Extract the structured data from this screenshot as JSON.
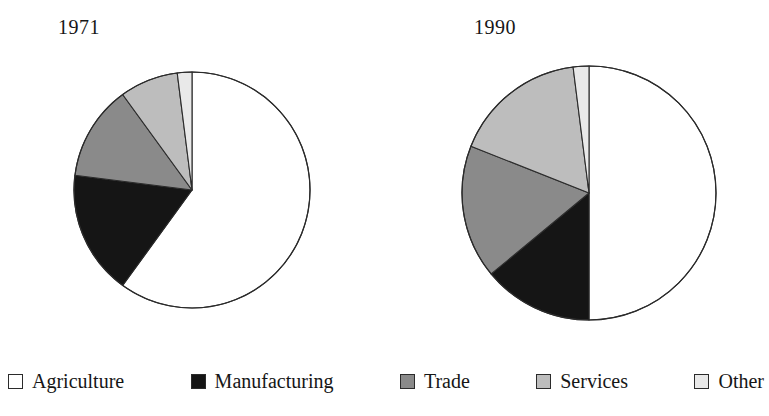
{
  "chart_data": {
    "type": "pie",
    "title": "",
    "categories": [
      "Agriculture",
      "Manufacturing",
      "Trade",
      "Services",
      "Other"
    ],
    "colors": [
      "#ffffff",
      "#151515",
      "#8a8a8a",
      "#bdbdbd",
      "#e9e9e9"
    ],
    "legend_position": "bottom",
    "charts": [
      {
        "title": "1971",
        "start_angle_deg": 0,
        "direction": "clockwise",
        "center": {
          "x": 122,
          "y": 122
        },
        "radius": 118,
        "values": [
          60,
          17,
          13,
          8,
          2
        ],
        "labels": [
          "Agriculture",
          "Manufacturing",
          "Trade",
          "Services",
          "Other"
        ]
      },
      {
        "title": "1990",
        "start_angle_deg": 0,
        "direction": "clockwise",
        "center": {
          "x": 131,
          "y": 131
        },
        "radius": 127,
        "values": [
          50,
          14,
          17,
          17,
          2
        ],
        "labels": [
          "Agriculture",
          "Manufacturing",
          "Trade",
          "Services",
          "Other"
        ]
      }
    ]
  },
  "titles": {
    "left": "1971",
    "right": "1990"
  },
  "legend": {
    "items": [
      {
        "label": "Agriculture",
        "color": "#ffffff"
      },
      {
        "label": "Manufacturing",
        "color": "#151515"
      },
      {
        "label": "Trade",
        "color": "#8a8a8a"
      },
      {
        "label": "Services",
        "color": "#bdbdbd"
      },
      {
        "label": "Other",
        "color": "#e9e9e9"
      }
    ]
  }
}
